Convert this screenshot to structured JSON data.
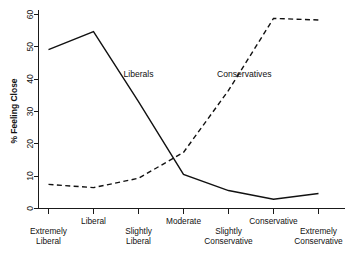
{
  "chart_data": {
    "type": "line",
    "title": "",
    "subtitle": "",
    "xlabel": "",
    "ylabel": "% Feeling Close",
    "grid": false,
    "legend_position": "inline-annotation",
    "categories": [
      "Extremely Liberal",
      "Liberal",
      "Slightly Liberal",
      "Moderate",
      "Slightly Conservative",
      "Conservative",
      "Extremely Conservative"
    ],
    "category_lines": [
      [
        "Extremely",
        "Liberal"
      ],
      [
        "Liberal"
      ],
      [
        "Slightly",
        "Liberal"
      ],
      [
        "Moderate"
      ],
      [
        "Slightly",
        "Conservative"
      ],
      [
        "Conservative"
      ],
      [
        "Extremely",
        "Conservative"
      ]
    ],
    "xlim": [
      0,
      6
    ],
    "ylim": [
      0,
      62
    ],
    "yticks": [
      0,
      10,
      20,
      30,
      40,
      50,
      60
    ],
    "ytick_labels": [
      "0",
      "10",
      "20",
      "30",
      "40",
      "50",
      "60"
    ],
    "series": [
      {
        "name": "Liberals",
        "style": "solid",
        "annotation": "Liberals",
        "annotation_x": 2.0,
        "annotation_y": 40.5,
        "values": [
          49.1,
          54.7,
          33.0,
          10.5,
          5.5,
          2.8,
          4.6
        ]
      },
      {
        "name": "Conservatives",
        "style": "dashed",
        "annotation": "Conservatives",
        "annotation_x": 4.35,
        "annotation_y": 40.5,
        "values": [
          7.4,
          6.4,
          9.3,
          17.3,
          36.5,
          58.8,
          58.3
        ]
      }
    ]
  },
  "colors": {
    "axis": "#1a1a1a",
    "series_line": "#111111",
    "background": "#ffffff"
  }
}
